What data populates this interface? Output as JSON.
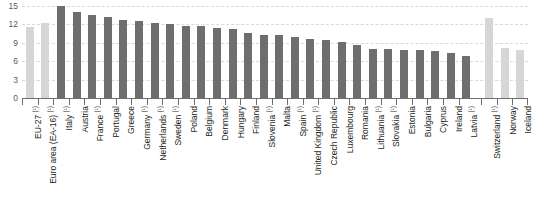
{
  "chart_data": {
    "type": "bar",
    "title": "",
    "xlabel": "",
    "ylabel": "",
    "ylim": [
      0,
      15
    ],
    "yticks": [
      0,
      3,
      6,
      9,
      12,
      15
    ],
    "ytick_labels": [
      "0",
      "3",
      "6",
      "9",
      "12",
      "15"
    ],
    "grid": true,
    "legend": "none",
    "orientation": "vertical",
    "categories": [
      "EU-27 (¹)",
      "Euro area (EA-16) (¹)",
      "Italy (¹)",
      "Austria",
      "France (¹)",
      "Portugal",
      "Greece",
      "Germany (¹)",
      "Netherlands (¹)",
      "Sweden (¹)",
      "Poland",
      "Belgium",
      "Denmark",
      "Hungary",
      "Finland",
      "Slovenia (¹)",
      "Malta",
      "Spain (¹)",
      "United Kingdom (¹)",
      "Czech Republic",
      "Luxembourg",
      "Romania",
      "Lithuania (¹)",
      "Slovakia (¹)",
      "Estonia",
      "Bulgaria",
      "Cyprus",
      "Ireland",
      "Latvia (¹)",
      "Switzerland (¹)",
      "Norway",
      "Iceland"
    ],
    "values": [
      11.6,
      12.2,
      15.0,
      14.0,
      13.6,
      13.2,
      12.8,
      12.5,
      12.2,
      12.0,
      11.8,
      11.7,
      11.4,
      11.3,
      10.6,
      10.2,
      10.2,
      9.9,
      9.6,
      9.5,
      9.2,
      8.7,
      8.0,
      8.0,
      7.8,
      7.8,
      7.6,
      7.3,
      6.8,
      13.0,
      8.1,
      7.8
    ],
    "series_groups": [
      {
        "name": "aggregates",
        "color": "#d6d6d6",
        "indices": [
          0,
          1
        ]
      },
      {
        "name": "member-states",
        "color": "#6e6e6e",
        "indices": [
          2,
          3,
          4,
          5,
          6,
          7,
          8,
          9,
          10,
          11,
          12,
          13,
          14,
          15,
          16,
          17,
          18,
          19,
          20,
          21,
          22,
          23,
          24,
          25,
          26,
          27,
          28
        ]
      },
      {
        "name": "non-member-countries",
        "color": "#d6d6d6",
        "indices": [
          29,
          30,
          31
        ]
      }
    ],
    "gap_before_index": 29,
    "colors": {
      "bar_dark": "#6e6e6e",
      "bar_light": "#d6d6d6",
      "gridline": "#d9d9d9",
      "axis": "#6d6e71",
      "tick_label": "#58595b",
      "category_label": "#231f20",
      "background": "#ffffff"
    }
  }
}
